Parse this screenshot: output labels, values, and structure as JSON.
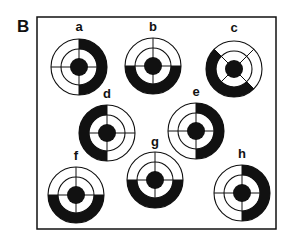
{
  "panel": {
    "label": "B",
    "frame": {
      "x": 37,
      "y": 17,
      "width": 239,
      "height": 212
    },
    "colors": {
      "ink": "#111111",
      "background": "#ffffff"
    }
  },
  "target_geometry": {
    "outer_radius": 28,
    "inner_radius": 18,
    "center_dot_radius": 9
  },
  "targets": [
    {
      "label": "a",
      "cx": 79,
      "cy": 67,
      "label_y": 31,
      "shaded_from_deg": -90,
      "shaded_to_deg": 90,
      "cross_rotation_deg": 0,
      "shaded_region": "right half"
    },
    {
      "label": "b",
      "cx": 153,
      "cy": 66,
      "label_y": 31,
      "shaded_from_deg": 0,
      "shaded_to_deg": 180,
      "cross_rotation_deg": 0,
      "shaded_region": "bottom half"
    },
    {
      "label": "c",
      "cx": 234,
      "cy": 69,
      "label_y": 32,
      "shaded_from_deg": 45,
      "shaded_to_deg": 225,
      "cross_rotation_deg": 45,
      "shaded_region": "lower-left half (diagonal)"
    },
    {
      "label": "d",
      "cx": 107,
      "cy": 133,
      "label_y": 98,
      "shaded_from_deg": 90,
      "shaded_to_deg": 270,
      "cross_rotation_deg": 0,
      "shaded_region": "left half"
    },
    {
      "label": "e",
      "cx": 196,
      "cy": 131,
      "label_y": 96,
      "shaded_from_deg": -90,
      "shaded_to_deg": 90,
      "cross_rotation_deg": 0,
      "shaded_region": "right half"
    },
    {
      "label": "f",
      "cx": 76,
      "cy": 195,
      "label_y": 160,
      "shaded_from_deg": 0,
      "shaded_to_deg": 180,
      "cross_rotation_deg": 0,
      "shaded_region": "bottom half"
    },
    {
      "label": "g",
      "cx": 155,
      "cy": 180,
      "label_y": 146,
      "shaded_from_deg": 0,
      "shaded_to_deg": 180,
      "cross_rotation_deg": 0,
      "shaded_region": "bottom half"
    },
    {
      "label": "h",
      "cx": 242,
      "cy": 193,
      "label_y": 158,
      "shaded_from_deg": -90,
      "shaded_to_deg": 90,
      "cross_rotation_deg": 0,
      "shaded_region": "right half"
    }
  ]
}
